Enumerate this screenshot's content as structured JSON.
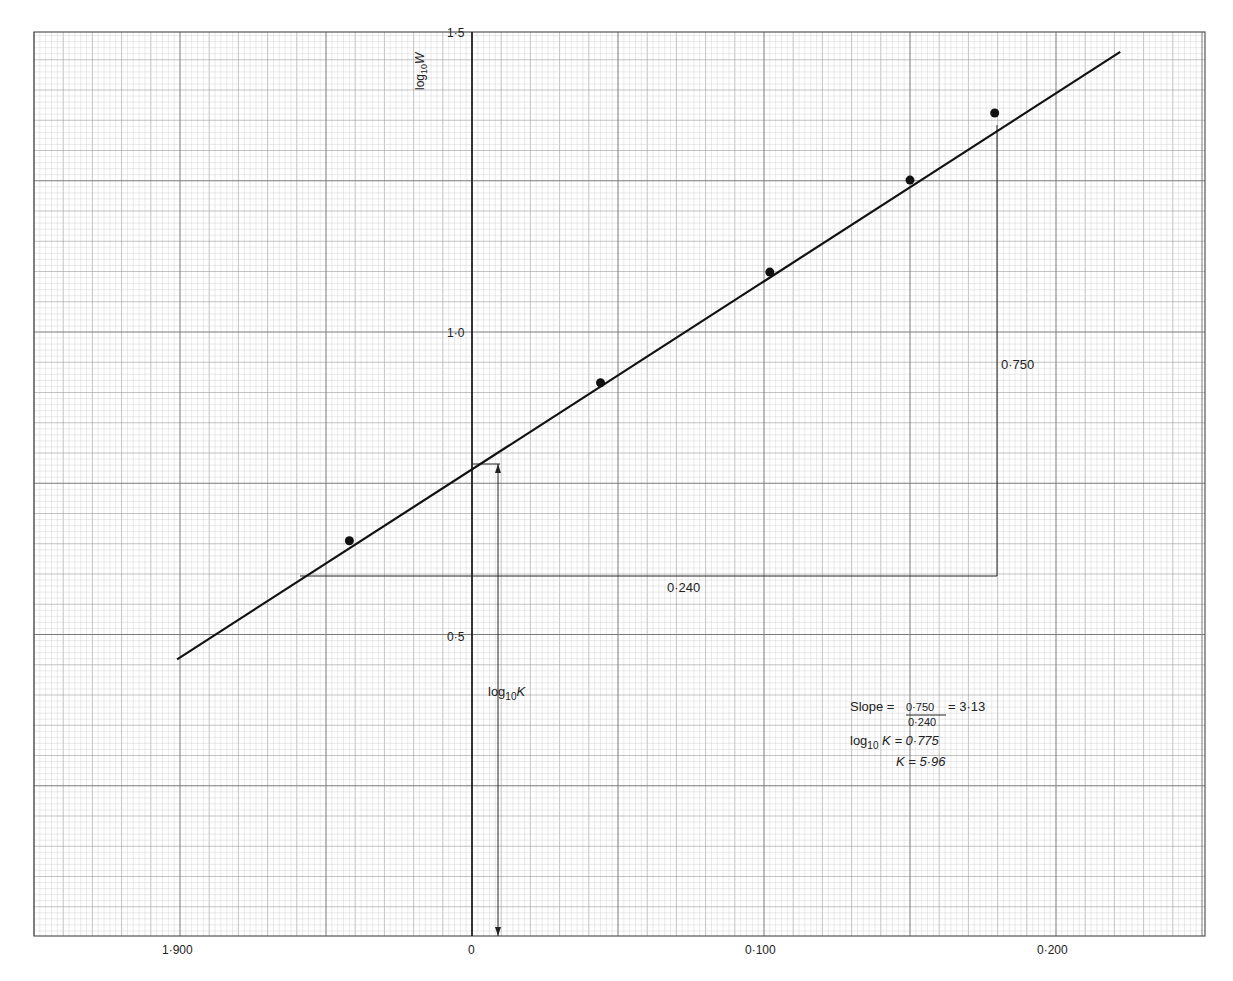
{
  "chart_data": {
    "type": "scatter",
    "title": "",
    "xlabel": "",
    "ylabel": "log10 W",
    "x_tick_labels": [
      "1·900",
      "0",
      "0·100",
      "0·200"
    ],
    "x_tick_values": [
      -0.1,
      0.0,
      0.1,
      0.2
    ],
    "x_tick_note": "1·900 is bar-notation (log of value < 1), i.e. -0.100 relative to 0",
    "y_tick_labels": [
      "0·5",
      "1·0",
      "1·5"
    ],
    "y_tick_values": [
      0.5,
      1.0,
      1.5
    ],
    "xlim": [
      -0.15,
      0.252
    ],
    "ylim": [
      0.0,
      1.5
    ],
    "grid": true,
    "grid_style": "fine graph paper (major every 0.050 x / 0.1 y, minor every 0.010 x / 0.02 y)",
    "series": [
      {
        "name": "measured points",
        "kind": "scatter",
        "x": [
          -0.042,
          0.044,
          0.102,
          0.15,
          0.179
        ],
        "y": [
          0.655,
          0.916,
          1.099,
          1.251,
          1.362
        ]
      },
      {
        "name": "best-fit line",
        "kind": "line",
        "x": [
          -0.101,
          0.222
        ],
        "y": [
          0.459,
          1.463
        ]
      }
    ],
    "annotations": {
      "slope_triangle": {
        "rise_label": "0·750",
        "run_label": "0·240",
        "corner_x": 0.18,
        "base_y": 0.595,
        "left_x": -0.059
      },
      "intercept": {
        "label_prefix": "log",
        "label_sub": "10",
        "label_suffix": "K",
        "y_value": 0.775
      },
      "results": {
        "slope_prefix": "Slope = ",
        "slope_numerator": "0·750",
        "slope_denominator": "0·240",
        "slope_value": "= 3·13",
        "logk_prefix": "log",
        "logk_sub": "10",
        "logk_suffix": " K = 0·775",
        "k_line": "K = 5·96"
      }
    }
  },
  "axis": {
    "y_label_main": "log",
    "y_label_sub": "10",
    "y_label_var": "W",
    "y_ticks": [
      "1·5",
      "1·0",
      "0·5"
    ],
    "x_ticks": [
      "1·900",
      "0",
      "0·100",
      "0·200"
    ]
  },
  "colors": {
    "paper": "#ffffff",
    "grid_minor": "#c9c9c9",
    "grid_major": "#7a7a7a",
    "ink": "#111111"
  }
}
